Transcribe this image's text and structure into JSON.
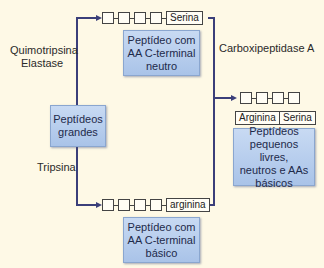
{
  "diagram": {
    "enzymes": {
      "chymotrypsin_elastase": [
        "Quimotripsina",
        "Elastase"
      ],
      "trypsin": "Tripsina",
      "carboxypeptidase": "Carboxipeptidase A"
    },
    "nodes": {
      "large_peptides": [
        "Peptídeos",
        "grandes"
      ],
      "neutral_c_term": [
        "Peptídeo com",
        "AA C-terminal",
        "neutro"
      ],
      "basic_c_term": [
        "Peptídeo com",
        "AA C-terminal",
        "básico"
      ],
      "products": [
        "Peptídeos",
        "pequenos livres,",
        "neutros e AAs",
        "básicos"
      ]
    },
    "chains": {
      "top_terminal": "Serina",
      "bottom_terminal": "arginina",
      "free_aa_1": "Arginina",
      "free_aa_2": "Serina"
    },
    "colors": {
      "background": "#fef9e6",
      "box_fill": "#b8cfee",
      "line": "#3b3f7a"
    }
  }
}
